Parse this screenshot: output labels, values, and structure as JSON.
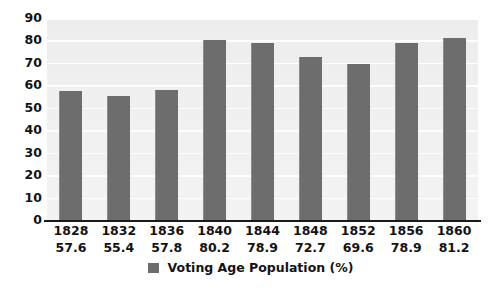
{
  "chart_data": {
    "type": "bar",
    "title": "",
    "subtitle": "",
    "xlabel": "",
    "ylabel": "",
    "categories": [
      "1828",
      "1832",
      "1836",
      "1840",
      "1844",
      "1848",
      "1852",
      "1856",
      "1860"
    ],
    "values": [
      57.6,
      55.4,
      57.8,
      80.2,
      78.9,
      72.7,
      69.6,
      78.9,
      81.2
    ],
    "value_labels": [
      "57.6",
      "55.4",
      "57.8",
      "80.2",
      "78.9",
      "72.7",
      "69.6",
      "78.9",
      "81.2"
    ],
    "series": [
      {
        "name": "Voting Age Population (%)",
        "values": [
          57.6,
          55.4,
          57.8,
          80.2,
          78.9,
          72.7,
          69.6,
          78.9,
          81.2
        ]
      }
    ],
    "ylim": [
      0,
      90
    ],
    "ytick_labels": [
      "0",
      "10",
      "20",
      "30",
      "40",
      "50",
      "60",
      "70",
      "80",
      "90"
    ],
    "ytick_values": [
      0,
      10,
      20,
      30,
      40,
      50,
      60,
      70,
      80,
      90
    ],
    "grid": true,
    "grid_axis": "y",
    "legend": {
      "position": "bottom",
      "entries": [
        {
          "label": "Voting Age Population (%)",
          "swatch_name": "legend-swatch-voting-age-population",
          "color": "#6d6d6d"
        }
      ]
    },
    "colors": {
      "bar": "#6d6d6d",
      "bar_highlight": "#8b8b8b",
      "plot_background": "#f0f0f0",
      "gridline": "#fdfdfd",
      "axis_line": "#1a1a1a",
      "text": "#131313",
      "page_background": "#ffffff"
    }
  }
}
